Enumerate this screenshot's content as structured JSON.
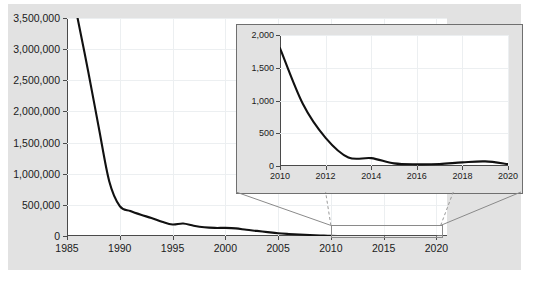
{
  "chart_data": [
    {
      "id": "main",
      "type": "line",
      "title": "",
      "xlabel": "",
      "ylabel": "",
      "xlim": [
        1985,
        2021
      ],
      "ylim": [
        0,
        3500000
      ],
      "grid": true,
      "legend": false,
      "xticks": [
        1985,
        1990,
        1995,
        2000,
        2005,
        2010,
        2015,
        2020
      ],
      "xticklabels": [
        "1985",
        "1990",
        "1995",
        "2000",
        "2005",
        "2010",
        "2015",
        "2020"
      ],
      "yticks": [
        0,
        500000,
        1000000,
        1500000,
        2000000,
        2500000,
        3000000,
        3500000
      ],
      "yticklabels": [
        "0",
        "500,000",
        "1,000,000",
        "1,500,000",
        "2,000,000",
        "2,500,000",
        "3,000,000",
        "3,500,000"
      ],
      "series": [
        {
          "name": "cases",
          "color": "#111111",
          "x": [
            1986,
            1987,
            1988,
            1989,
            1990,
            1991,
            1992,
            1993,
            1994,
            1995,
            1996,
            1997,
            1998,
            1999,
            2000,
            2001,
            2002,
            2003,
            2004,
            2005,
            2006,
            2007,
            2008,
            2009,
            2010,
            2011,
            2012,
            2013,
            2014,
            2015,
            2016,
            2017,
            2018,
            2019,
            2020
          ],
          "values": [
            3500000,
            2650000,
            1750000,
            880000,
            480000,
            400000,
            340000,
            290000,
            230000,
            185000,
            200000,
            165000,
            140000,
            130000,
            130000,
            122000,
            100000,
            82000,
            62000,
            44000,
            33000,
            24000,
            16000,
            9000,
            1800,
            950,
            430,
            130,
            120,
            40,
            25,
            30,
            55,
            70,
            30
          ]
        }
      ]
    },
    {
      "id": "inset",
      "type": "line",
      "title": "",
      "xlabel": "",
      "ylabel": "",
      "xlim": [
        2010,
        2020
      ],
      "ylim": [
        0,
        2000
      ],
      "grid": true,
      "legend": false,
      "xticks": [
        2010,
        2012,
        2014,
        2016,
        2018,
        2020
      ],
      "xticklabels": [
        "2010",
        "2012",
        "2014",
        "2016",
        "2018",
        "2020"
      ],
      "yticks": [
        0,
        500,
        1000,
        1500,
        2000
      ],
      "yticklabels": [
        "0",
        "500",
        "1,000",
        "1,500",
        "2,000"
      ],
      "series": [
        {
          "name": "cases",
          "color": "#111111",
          "x": [
            2010,
            2011,
            2012,
            2013,
            2014,
            2015,
            2016,
            2017,
            2018,
            2019,
            2020
          ],
          "values": [
            1800,
            950,
            430,
            130,
            120,
            40,
            25,
            30,
            55,
            70,
            30
          ]
        }
      ]
    }
  ],
  "colors": {
    "line": "#111111",
    "panel_background": "#e2e2e2",
    "plot_background": "#ffffff",
    "axis": "#4a4a4a",
    "grid": "#eceff1",
    "callout": "#8a8a8a"
  }
}
